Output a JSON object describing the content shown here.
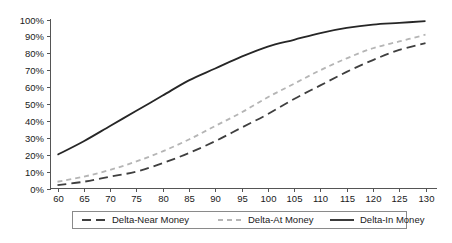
{
  "chart_data": {
    "type": "line",
    "title": "",
    "xlabel": "",
    "ylabel": "",
    "x": [
      60,
      65,
      70,
      75,
      80,
      85,
      90,
      95,
      100,
      105,
      110,
      115,
      120,
      125,
      130
    ],
    "xtick_labels": [
      "60",
      "65",
      "70",
      "75",
      "80",
      "85",
      "90",
      "95",
      "100",
      "105",
      "110",
      "115",
      "120",
      "125",
      "130"
    ],
    "ytick_labels": [
      "0%",
      "10%",
      "20%",
      "30%",
      "40%",
      "50%",
      "60%",
      "70%",
      "80%",
      "90%",
      "100%"
    ],
    "ytick_values": [
      0,
      10,
      20,
      30,
      40,
      50,
      60,
      70,
      80,
      90,
      100
    ],
    "xlim": [
      60,
      130
    ],
    "ylim": [
      0,
      100
    ],
    "grid": false,
    "legend_position": "bottom",
    "series": [
      {
        "name": "Delta-Near Money",
        "color": "#3f3f3f",
        "dash": "9,5",
        "width": 1.8,
        "values": [
          2,
          4,
          7,
          10,
          15,
          21,
          28,
          36,
          44,
          53,
          61,
          69,
          76,
          82,
          86
        ]
      },
      {
        "name": "Delta-At Money",
        "color": "#b5b5b5",
        "dash": "5,4",
        "width": 1.8,
        "values": [
          4,
          7,
          11,
          16,
          22,
          29,
          37,
          45,
          54,
          62,
          70,
          77,
          83,
          87,
          91
        ]
      },
      {
        "name": "Delta-In Money",
        "color": "#262626",
        "dash": "none",
        "width": 1.8,
        "values": [
          20,
          28,
          37,
          46,
          55,
          64,
          71,
          78,
          84,
          88,
          92,
          95,
          97,
          98,
          99
        ]
      }
    ]
  },
  "legend": {
    "items": [
      {
        "label": "Delta-Near Money"
      },
      {
        "label": "Delta-At Money"
      },
      {
        "label": "Delta-In Money"
      }
    ]
  }
}
